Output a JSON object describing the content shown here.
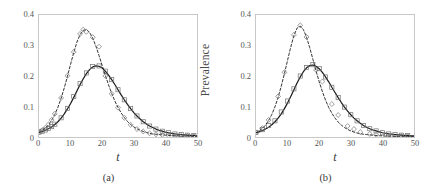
{
  "figure": {
    "panels": [
      {
        "caption": "(a)",
        "xlabel": "t",
        "ylabel": "Prevalence",
        "chart_index": 0
      },
      {
        "caption": "(b)",
        "xlabel": "t",
        "ylabel": "Prevalence",
        "chart_index": 1
      }
    ]
  },
  "axes": {
    "y_ticks": [
      "0.4",
      "0.3",
      "0.2",
      "0.1",
      "0"
    ],
    "y_tick_values": [
      0.4,
      0.3,
      0.2,
      0.1,
      0
    ],
    "x_ticks": [
      "0",
      "10",
      "20",
      "30",
      "40",
      "50"
    ],
    "x_tick_values": [
      0,
      10,
      20,
      30,
      40,
      50
    ],
    "xlim": [
      0,
      50
    ],
    "ylim": [
      0,
      0.4
    ]
  },
  "style": {
    "frame_color": "#c8c8c8",
    "curve_color": "#1a1a1a",
    "marker_color": "#6f6f6f",
    "text_color": "#3a3a3a",
    "background": "#ffffff"
  },
  "chart_data": [
    {
      "type": "line",
      "title": "",
      "subtitle": "(a)",
      "xlabel": "t",
      "ylabel": "Prevalence",
      "xlim": [
        0,
        50
      ],
      "ylim": [
        0,
        0.4
      ],
      "grid": false,
      "legend_position": "none",
      "series": [
        {
          "name": "model-solid",
          "style": "solid",
          "marker": "none",
          "x": [
            0,
            1,
            2,
            3,
            4,
            5,
            6,
            7,
            8,
            9,
            10,
            11,
            12,
            13,
            14,
            15,
            16,
            17,
            18,
            19,
            20,
            21,
            22,
            23,
            24,
            25,
            26,
            27,
            28,
            29,
            30,
            31,
            32,
            33,
            34,
            35,
            36,
            37,
            38,
            39,
            40,
            41,
            42,
            43,
            44,
            45,
            46,
            47,
            48,
            49,
            50
          ],
          "y": [
            0.015,
            0.018,
            0.022,
            0.027,
            0.033,
            0.041,
            0.05,
            0.062,
            0.076,
            0.092,
            0.11,
            0.13,
            0.151,
            0.172,
            0.191,
            0.208,
            0.221,
            0.23,
            0.233,
            0.232,
            0.226,
            0.216,
            0.203,
            0.188,
            0.172,
            0.155,
            0.138,
            0.122,
            0.107,
            0.093,
            0.08,
            0.069,
            0.059,
            0.05,
            0.043,
            0.036,
            0.031,
            0.026,
            0.022,
            0.019,
            0.016,
            0.014,
            0.012,
            0.01,
            0.009,
            0.008,
            0.007,
            0.006,
            0.005,
            0.005,
            0.004
          ]
        },
        {
          "name": "data-square",
          "style": "none",
          "marker": "square",
          "x": [
            0,
            1,
            2,
            3,
            4,
            5,
            7,
            9,
            11,
            13,
            15,
            17,
            19,
            21,
            23,
            25,
            27,
            29,
            31,
            33,
            35,
            37,
            39,
            41,
            43,
            45,
            47,
            49
          ],
          "y": [
            0.016,
            0.019,
            0.023,
            0.028,
            0.034,
            0.042,
            0.063,
            0.094,
            0.133,
            0.175,
            0.21,
            0.231,
            0.233,
            0.216,
            0.188,
            0.155,
            0.122,
            0.093,
            0.069,
            0.05,
            0.036,
            0.026,
            0.019,
            0.014,
            0.01,
            0.008,
            0.006,
            0.005
          ]
        },
        {
          "name": "model-dashed",
          "style": "dashed",
          "marker": "none",
          "x": [
            0,
            1,
            2,
            3,
            4,
            5,
            6,
            7,
            8,
            9,
            10,
            11,
            12,
            13,
            14,
            15,
            16,
            17,
            18,
            19,
            20,
            21,
            22,
            23,
            24,
            25,
            26,
            27,
            28,
            29,
            30,
            31,
            32,
            33,
            34,
            35,
            36,
            37,
            38,
            39,
            40,
            41,
            42,
            43,
            44,
            45,
            46,
            47,
            48,
            49,
            50
          ],
          "y": [
            0.015,
            0.021,
            0.029,
            0.04,
            0.055,
            0.074,
            0.098,
            0.127,
            0.161,
            0.199,
            0.239,
            0.277,
            0.311,
            0.336,
            0.35,
            0.352,
            0.343,
            0.324,
            0.298,
            0.267,
            0.234,
            0.202,
            0.171,
            0.143,
            0.118,
            0.097,
            0.079,
            0.064,
            0.051,
            0.041,
            0.033,
            0.027,
            0.022,
            0.018,
            0.015,
            0.012,
            0.01,
            0.009,
            0.008,
            0.007,
            0.006,
            0.005,
            0.005,
            0.004,
            0.004,
            0.003,
            0.003,
            0.003,
            0.002,
            0.002,
            0.002
          ]
        },
        {
          "name": "data-diamond",
          "style": "none",
          "marker": "diamond",
          "x": [
            0,
            1,
            2,
            3,
            4,
            5,
            7,
            9,
            11,
            13,
            14,
            15,
            17,
            19,
            21,
            23,
            25,
            27,
            29,
            31,
            33,
            35,
            37,
            39,
            41,
            43,
            45,
            47,
            49
          ],
          "y": [
            0.016,
            0.022,
            0.03,
            0.041,
            0.056,
            0.076,
            0.128,
            0.201,
            0.279,
            0.338,
            0.352,
            0.345,
            0.327,
            0.296,
            0.2,
            0.142,
            0.096,
            0.063,
            0.04,
            0.026,
            0.018,
            0.012,
            0.009,
            0.007,
            0.005,
            0.004,
            0.003,
            0.003,
            0.002
          ]
        }
      ]
    },
    {
      "type": "line",
      "title": "",
      "subtitle": "(b)",
      "xlabel": "t",
      "ylabel": "Prevalence",
      "xlim": [
        0,
        50
      ],
      "ylim": [
        0,
        0.4
      ],
      "grid": false,
      "legend_position": "none",
      "series": [
        {
          "name": "model-solid",
          "style": "solid",
          "marker": "none",
          "x": [
            0,
            1,
            2,
            3,
            4,
            5,
            6,
            7,
            8,
            9,
            10,
            11,
            12,
            13,
            14,
            15,
            16,
            17,
            18,
            19,
            20,
            21,
            22,
            23,
            24,
            25,
            26,
            27,
            28,
            29,
            30,
            31,
            32,
            33,
            34,
            35,
            36,
            37,
            38,
            39,
            40,
            41,
            42,
            43,
            44,
            45,
            46,
            47,
            48,
            49,
            50
          ],
          "y": [
            0.014,
            0.017,
            0.021,
            0.026,
            0.032,
            0.04,
            0.05,
            0.062,
            0.076,
            0.093,
            0.112,
            0.133,
            0.155,
            0.177,
            0.197,
            0.214,
            0.227,
            0.234,
            0.236,
            0.232,
            0.224,
            0.212,
            0.197,
            0.181,
            0.163,
            0.146,
            0.129,
            0.113,
            0.098,
            0.085,
            0.073,
            0.062,
            0.053,
            0.045,
            0.038,
            0.032,
            0.027,
            0.023,
            0.02,
            0.017,
            0.014,
            0.012,
            0.01,
            0.009,
            0.008,
            0.007,
            0.006,
            0.005,
            0.005,
            0.004,
            0.004
          ]
        },
        {
          "name": "data-square",
          "style": "none",
          "marker": "square",
          "x": [
            0,
            2,
            4,
            6,
            8,
            10,
            12,
            14,
            16,
            18,
            20,
            22,
            24,
            26,
            28,
            30,
            32,
            34,
            36,
            38,
            40,
            42,
            44,
            46,
            48
          ],
          "y": [
            0.015,
            0.024,
            0.038,
            0.053,
            0.082,
            0.118,
            0.158,
            0.2,
            0.228,
            0.237,
            0.224,
            0.197,
            0.163,
            0.129,
            0.098,
            0.073,
            0.053,
            0.038,
            0.027,
            0.02,
            0.014,
            0.01,
            0.008,
            0.006,
            0.005
          ]
        },
        {
          "name": "model-dashed",
          "style": "dashed",
          "marker": "none",
          "x": [
            0,
            1,
            2,
            3,
            4,
            5,
            6,
            7,
            8,
            9,
            10,
            11,
            12,
            13,
            14,
            15,
            16,
            17,
            18,
            19,
            20,
            21,
            22,
            23,
            24,
            25,
            26,
            27,
            28,
            29,
            30,
            31,
            32,
            33,
            34,
            35,
            36,
            37,
            38,
            39,
            40,
            41,
            42,
            43,
            44,
            45,
            46,
            47,
            48,
            49,
            50
          ],
          "y": [
            0.014,
            0.02,
            0.028,
            0.039,
            0.054,
            0.074,
            0.099,
            0.13,
            0.167,
            0.208,
            0.252,
            0.295,
            0.333,
            0.357,
            0.364,
            0.352,
            0.327,
            0.293,
            0.255,
            0.217,
            0.181,
            0.149,
            0.121,
            0.097,
            0.078,
            0.062,
            0.049,
            0.039,
            0.031,
            0.025,
            0.02,
            0.016,
            0.013,
            0.011,
            0.009,
            0.008,
            0.007,
            0.006,
            0.005,
            0.004,
            0.004,
            0.003,
            0.003,
            0.003,
            0.002,
            0.002,
            0.002,
            0.002,
            0.002,
            0.001,
            0.001
          ]
        },
        {
          "name": "data-diamond",
          "style": "none",
          "marker": "diamond",
          "x": [
            0,
            2,
            4,
            7,
            9,
            12,
            14,
            16,
            19,
            21,
            24,
            26,
            29,
            31,
            33,
            36,
            38,
            41,
            43,
            46,
            48
          ],
          "y": [
            0.015,
            0.029,
            0.056,
            0.133,
            0.212,
            0.335,
            0.366,
            0.328,
            0.22,
            0.182,
            0.108,
            0.072,
            0.036,
            0.026,
            0.016,
            0.01,
            0.007,
            0.005,
            0.004,
            0.003,
            0.002
          ]
        }
      ]
    }
  ]
}
